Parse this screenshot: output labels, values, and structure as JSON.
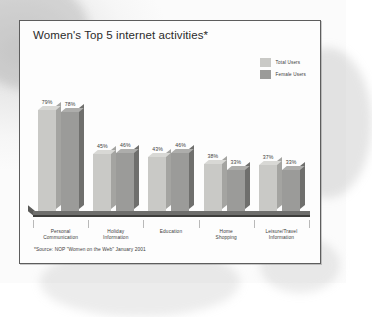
{
  "card": {
    "title": "Women's Top 5 internet activities*",
    "source_note": "*Source: NOP \"Women on the Web\" January 2001"
  },
  "legend": {
    "items": [
      {
        "label": "Total Users",
        "color": "#c9c9c6"
      },
      {
        "label": "Female Users",
        "color": "#9b9b99"
      }
    ]
  },
  "colors": {
    "total_users_face": "#c9c9c6",
    "total_users_side": "#a4a4a1",
    "total_users_top": "#d8d8d5",
    "female_users_face": "#9b9b99",
    "female_users_side": "#6f6f6d",
    "female_users_top": "#adadab",
    "floor": "#6e6e6c",
    "frame": "#5d5d5d",
    "text": "#3c3c3c"
  },
  "chart_data": {
    "type": "bar",
    "title": "Women's Top 5 internet activities*",
    "xlabel": "",
    "ylabel": "",
    "ylim": [
      0,
      100
    ],
    "grid": false,
    "legend_position": "top-right",
    "annotation": "*Source: NOP \"Women on the Web\" January 2001",
    "value_suffix": "%",
    "categories": [
      "Personal Communication",
      "Holiday Information",
      "Education",
      "Home Shopping",
      "Leisure/Travel Information"
    ],
    "series": [
      {
        "name": "Total Users",
        "values": [
          79,
          45,
          43,
          38,
          37
        ],
        "labels": [
          "79%",
          "45%",
          "43%",
          "38%",
          "37%"
        ]
      },
      {
        "name": "Female Users",
        "values": [
          78,
          46,
          46,
          33,
          33
        ],
        "labels": [
          "78%",
          "46%",
          "46%",
          "33%",
          "33%"
        ]
      }
    ],
    "category_label_lines": [
      [
        "Personal",
        "Communication"
      ],
      [
        "Holiday",
        "Information"
      ],
      [
        "Education",
        ""
      ],
      [
        "Home",
        "Shopping"
      ],
      [
        "Leisure/Travel",
        "Information"
      ]
    ]
  }
}
